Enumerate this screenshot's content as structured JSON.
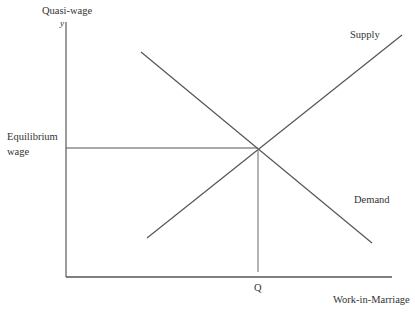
{
  "diagram": {
    "y_axis_label": "Quasi-wage",
    "y_axis_symbol": "y",
    "x_axis_label": "Work-in-Marriage",
    "equilibrium_label_line1": "Equilibrium",
    "equilibrium_label_line2": "wage",
    "quantity_label": "Q",
    "supply_label": "Supply",
    "demand_label": "Demand",
    "line_color": "#555555"
  }
}
